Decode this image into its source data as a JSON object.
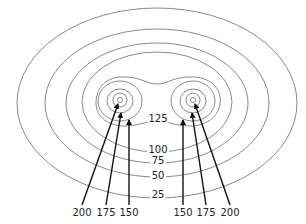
{
  "diagram": {
    "title": "",
    "contour_labels": {
      "c125": "125",
      "c100": "100",
      "c75": "75",
      "c50": "50",
      "c25": "25"
    },
    "pointer_labels": {
      "left_200": "200",
      "left_175": "175",
      "left_150": "150",
      "right_150": "150",
      "right_175": "175",
      "right_200": "200"
    },
    "colors": {
      "contour_stroke": "#8a8a8a",
      "arrow_stroke": "#111111",
      "text": "#222222",
      "background": "#ffffff"
    }
  }
}
